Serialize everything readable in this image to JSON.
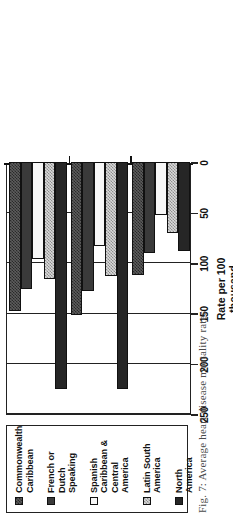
{
  "figure": {
    "caption": "Fig. 7: Average heart disease mortality rates"
  },
  "legend": {
    "items": [
      {
        "label": "Commonwealth Caribbean",
        "swatch": "dark-checker-swatch",
        "color": "#5d5d5d"
      },
      {
        "label": "French or Dutch Speaking",
        "swatch": "solid-dark-swatch",
        "color": "#3a3a3a"
      },
      {
        "label": "Spanish Caribbean & Central America",
        "swatch": "white-swatch",
        "color": "#f7f7f7"
      },
      {
        "label": "Latin South America",
        "swatch": "light-checker-swatch",
        "color": "#d9d9d9"
      },
      {
        "label": "North America",
        "swatch": "solid-black-swatch",
        "color": "#262626"
      }
    ]
  },
  "axis": {
    "title_line1": "Rate per 100",
    "title_line2": "thousand",
    "ticks": [
      "250",
      "200",
      "150",
      "100",
      "50",
      "0"
    ]
  },
  "categories": [
    {
      "label_line1": "Mortality",
      "label_line2": "",
      "label_line3": ""
    },
    {
      "label_line1": "Female",
      "label_line2": "mortality",
      "label_line3": ""
    },
    {
      "label_line1": "Age-",
      "label_line2": "adjusted",
      "label_line3": "female",
      "label_line4": "mortality"
    }
  ],
  "chart_data": {
    "type": "bar",
    "orientation": "horizontal",
    "title": "Fig. 7: Average heart disease mortality rates",
    "xlabel": "Rate per 100 thousand",
    "ylabel": "",
    "xlim": [
      0,
      250
    ],
    "grid": true,
    "legend_position": "left",
    "categories": [
      "Mortality",
      "Female mortality",
      "Age-adjusted female mortality"
    ],
    "series": [
      {
        "name": "Commonwealth Caribbean",
        "values": [
          148,
          152,
          112
        ]
      },
      {
        "name": "French or Dutch Speaking",
        "values": [
          126,
          128,
          90
        ]
      },
      {
        "name": "Spanish Caribbean & Central America",
        "values": [
          96,
          83,
          53
        ]
      },
      {
        "name": "Latin South America",
        "values": [
          116,
          113,
          70
        ]
      },
      {
        "name": "North America",
        "values": [
          225,
          225,
          88
        ]
      }
    ]
  }
}
